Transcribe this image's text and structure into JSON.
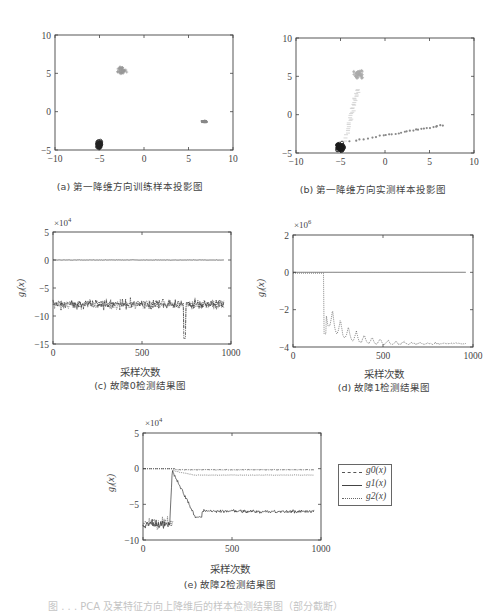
{
  "captions": {
    "a": "(a) 第一降维方向训练样本投影图",
    "b": "(b) 第一降维方向实测样本投影图",
    "c": "(c) 故障0检测结果图",
    "d": "(d) 故障1检测结果图",
    "e": "(e) 故障2检测结果图",
    "figure": "图 . . .  PCA 及某特征方向上降维后的样本检测结果图（部分截断）"
  },
  "xlabel": "采样次数",
  "ylabel": "g_i(x)",
  "legend": {
    "items": [
      {
        "label": "g0(x)",
        "style": "dash-dot"
      },
      {
        "label": "g1(x)",
        "style": "solid"
      },
      {
        "label": "g2(x)",
        "style": "dotted"
      }
    ]
  },
  "chart_data": [
    {
      "id": "a",
      "type": "scatter",
      "title": "(a) 第一降维方向训练样本投影图",
      "xlim": [
        -10,
        10
      ],
      "ylim": [
        -5,
        10
      ],
      "xticks": [
        -10,
        -5,
        0,
        5,
        10
      ],
      "yticks": [
        -5,
        0,
        5,
        10
      ],
      "grid": false,
      "clusters": [
        {
          "label": "class0",
          "center": [
            -5,
            -4.3
          ],
          "spread": [
            0.35,
            0.6
          ],
          "color": "#222",
          "marker": "o"
        },
        {
          "label": "class1",
          "center": [
            -2.5,
            5.4
          ],
          "spread": [
            0.7,
            0.6
          ],
          "color": "#999",
          "marker": "+"
        },
        {
          "label": "class2",
          "center": [
            6.8,
            -1.3
          ],
          "spread": [
            0.4,
            0.15
          ],
          "color": "#888",
          "marker": "*"
        }
      ]
    },
    {
      "id": "b",
      "type": "scatter",
      "title": "(b) 第一降维方向实测样本投影图",
      "xlim": [
        -10,
        10
      ],
      "ylim": [
        -5,
        10
      ],
      "xticks": [
        -10,
        -5,
        0,
        5,
        10
      ],
      "yticks": [
        -5,
        0,
        5,
        10
      ],
      "grid": false,
      "clusters": [
        {
          "label": "class0",
          "center": [
            -5,
            -4.2
          ],
          "spread": [
            0.5,
            0.7
          ],
          "color": "#1a1a1a",
          "marker": "o"
        },
        {
          "label": "class1",
          "center": [
            -3.0,
            5.3
          ],
          "spread": [
            0.7,
            0.9
          ],
          "color": "#aaa",
          "marker": "+"
        },
        {
          "label": "class2-trail",
          "from": [
            -4,
            -3.5
          ],
          "to": [
            6.8,
            -1.3
          ],
          "color": "#888",
          "marker": "*"
        },
        {
          "label": "class1-trail",
          "from": [
            -4.5,
            -3.5
          ],
          "to": [
            -3.0,
            3.5
          ],
          "color": "#bbb",
          "marker": "-"
        }
      ]
    },
    {
      "id": "c",
      "type": "line",
      "title": "(c) 故障0检测结果图",
      "xlabel": "采样次数",
      "ylabel": "g_i(x)",
      "scale_label": "×10^4",
      "xlim": [
        0,
        1000
      ],
      "ylim": [
        -15,
        5
      ],
      "xticks": [
        0,
        500,
        1000
      ],
      "yticks": [
        -15,
        -10,
        -5,
        0,
        5
      ],
      "series": [
        {
          "name": "g0(x)",
          "level": -7.8,
          "noise": 1.2,
          "style": "dash-dot",
          "spike": {
            "x": 740,
            "y": -14
          }
        },
        {
          "name": "g1(x)",
          "level": 0,
          "noise": 0.05,
          "style": "solid"
        },
        {
          "name": "g2(x)",
          "level": -8.0,
          "noise": 1.0,
          "style": "dotted"
        }
      ]
    },
    {
      "id": "d",
      "type": "line",
      "title": "(d) 故障1检测结果图",
      "xlabel": "采样次数",
      "ylabel": "g_i(x)",
      "scale_label": "×10^6",
      "xlim": [
        0,
        1000
      ],
      "ylim": [
        -4,
        2
      ],
      "xticks": [
        0,
        500,
        1000
      ],
      "yticks": [
        -4,
        -2,
        0,
        2
      ],
      "series": [
        {
          "name": "g0(x)",
          "level": 0,
          "style": "dash-dot"
        },
        {
          "name": "g1(x)",
          "level": 0,
          "style": "solid"
        },
        {
          "name": "g2(x)",
          "level_before": -0.05,
          "drop_at": 170,
          "decay_to": -3.8,
          "style": "dotted"
        }
      ]
    },
    {
      "id": "e",
      "type": "line",
      "title": "(e) 故障2检测结果图",
      "xlabel": "采样次数",
      "ylabel": "g_i(x)",
      "scale_label": "×10^4",
      "xlim": [
        0,
        1000
      ],
      "ylim": [
        -10,
        5
      ],
      "xticks": [
        0,
        500,
        1000
      ],
      "yticks": [
        -10,
        -5,
        0,
        5
      ],
      "legend_position": "right-outside",
      "series": [
        {
          "name": "g0(x)",
          "before": 0,
          "after": -0.2,
          "style": "dash-dot"
        },
        {
          "name": "g1(x)",
          "before": 0,
          "after": -6.0,
          "transition": [
            160,
            300
          ],
          "style": "solid"
        },
        {
          "name": "g2(x)",
          "before": -7.8,
          "after": -0.9,
          "transition": [
            150,
            170
          ],
          "style": "dotted"
        }
      ]
    }
  ]
}
